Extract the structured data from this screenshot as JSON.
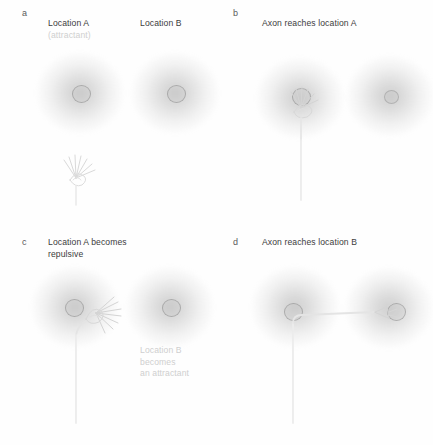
{
  "figure": {
    "type": "scientific-diagram",
    "background_color": "#fefefe"
  },
  "panels": [
    {
      "letter": "a",
      "title": "",
      "labels": {
        "location_a": "Location A",
        "location_a_sub": "(attractant)",
        "location_b": "Location B"
      },
      "elements": {
        "growth_cone": "free growth cone below location A, filopodia fanned upward",
        "blob_a": "attractant gradient at location A",
        "blob_b": "inactive gradient at location B"
      }
    },
    {
      "letter": "b",
      "title": "Axon reaches location A",
      "labels": {},
      "elements": {
        "growth_cone": "growth cone at location A with long vertical axon",
        "blob_a": "attractant gradient at location A",
        "blob_b": "inactive gradient at location B"
      }
    },
    {
      "letter": "c",
      "title": "Location A becomes\nrepulsive",
      "labels": {
        "location_b_sub": "Location B\nbecomes\nan attractant"
      },
      "elements": {
        "growth_cone": "growth cone turning right away from location A",
        "blob_a": "now repulsive gradient at location A",
        "blob_b": "newly attractive gradient at location B"
      }
    },
    {
      "letter": "d",
      "title": "Axon reaches location B",
      "labels": {},
      "elements": {
        "growth_cone": "growth cone arriving at location B",
        "axon": "axon turns right at location A and extends to location B",
        "blob_a": "gradient at location A",
        "blob_b": "gradient at location B"
      }
    }
  ],
  "colors": {
    "title_text": "#3c3c3c",
    "panel_letter": "#5a5a5a",
    "faded_text": "#cfcfcf",
    "blob_grey": "#787878",
    "neuron_outline": "#d8d8d8"
  }
}
